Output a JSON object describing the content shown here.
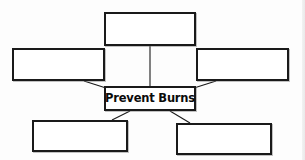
{
  "diagram": {
    "type": "concept-map",
    "title": "Prevent Burns",
    "center": {
      "id": "center",
      "label": "Prevent Burns",
      "filled": true
    },
    "nodes": [
      {
        "id": "top",
        "label": "",
        "position": "top",
        "filled": false
      },
      {
        "id": "left",
        "label": "",
        "position": "upper-left",
        "filled": false
      },
      {
        "id": "right",
        "label": "",
        "position": "upper-right",
        "filled": false
      },
      {
        "id": "bottom-left",
        "label": "",
        "position": "lower-left",
        "filled": false
      },
      {
        "id": "bottom-right",
        "label": "",
        "position": "lower-right",
        "filled": false
      }
    ],
    "connectors": [
      {
        "from": "center",
        "to": "top"
      },
      {
        "from": "center",
        "to": "left"
      },
      {
        "from": "center",
        "to": "right"
      },
      {
        "from": "center",
        "to": "bottom-left"
      },
      {
        "from": "center",
        "to": "bottom-right"
      }
    ],
    "colors": {
      "border": "#1a1a1a",
      "fill": "#ffffff",
      "background": "#fdfdfd",
      "text": "#0b0b0b",
      "connector": "#1a1a1a"
    }
  }
}
